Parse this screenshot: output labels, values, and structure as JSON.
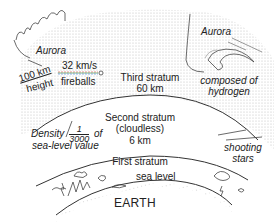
{
  "diagram": {
    "colors": {
      "line": "#333333",
      "dots": "#c8c8c8",
      "background": "#ffffff",
      "fireball_trail": [
        "#e06060",
        "#60b060",
        "#6090e0"
      ]
    },
    "labels": {
      "aurora_left": "Aurora",
      "aurora_right": "Aurora",
      "height_value": "100 km",
      "height_word": "height",
      "speed": "32 km/s",
      "fireballs": "fireballs",
      "third_stratum": "Third stratum",
      "third_stratum_height": "60 km",
      "composed_of": "composed of",
      "hydrogen": "hydrogen",
      "second_stratum": "Second stratum",
      "second_stratum_note": "(cloudless)",
      "second_stratum_height": "6 km",
      "density_word": "Density",
      "density_num": "1",
      "density_den": "3000",
      "density_of": "of",
      "density_suffix": "sea-level value",
      "first_stratum": "First stratum",
      "sea_level": "sea level",
      "shooting": "shooting",
      "stars": "stars",
      "earth": "EARTH"
    }
  }
}
